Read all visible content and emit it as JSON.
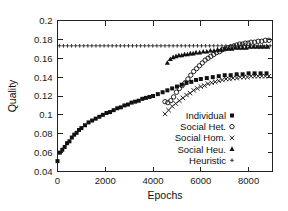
{
  "chart_data": {
    "type": "scatter",
    "title": "",
    "xlabel": "Epochs",
    "ylabel": "Quality",
    "xlim": [
      0,
      9000
    ],
    "ylim": [
      0.04,
      0.2
    ],
    "xticks": [
      0,
      2000,
      4000,
      6000,
      8000
    ],
    "xtick_labels": [
      "0",
      "2000",
      "4000",
      "6000",
      "8000"
    ],
    "yticks": [
      0.04,
      0.06,
      0.08,
      0.1,
      0.12,
      0.14,
      0.16,
      0.18,
      0.2
    ],
    "ytick_labels": [
      "0.04",
      "0.06",
      "0.08",
      "0.1",
      "0.12",
      "0.14",
      "0.16",
      "0.18",
      "0.2"
    ],
    "grid": false,
    "legend_position": "center-right-inside",
    "series": [
      {
        "name": "Individual",
        "marker": "filled-square",
        "x": [
          0,
          100,
          200,
          300,
          400,
          500,
          600,
          700,
          800,
          900,
          1000,
          1150,
          1300,
          1450,
          1600,
          1750,
          1900,
          2050,
          2200,
          2350,
          2500,
          2650,
          2800,
          2950,
          3100,
          3250,
          3400,
          3550,
          3700,
          3850,
          4000,
          4200,
          4400,
          4600,
          4800,
          5000,
          5200,
          5400,
          5600,
          5800,
          6000,
          6250,
          6500,
          6750,
          7000,
          7250,
          7500,
          7750,
          8000,
          8250,
          8500,
          8750
        ],
        "y": [
          0.051,
          0.06,
          0.063,
          0.066,
          0.07,
          0.072,
          0.076,
          0.079,
          0.081,
          0.084,
          0.086,
          0.089,
          0.092,
          0.094,
          0.096,
          0.098,
          0.1,
          0.102,
          0.103,
          0.105,
          0.107,
          0.108,
          0.11,
          0.111,
          0.113,
          0.114,
          0.115,
          0.117,
          0.118,
          0.119,
          0.12,
          0.122,
          0.124,
          0.126,
          0.128,
          0.13,
          0.132,
          0.134,
          0.135,
          0.137,
          0.138,
          0.139,
          0.14,
          0.141,
          0.142,
          0.142,
          0.143,
          0.143,
          0.144,
          0.144,
          0.144,
          0.144
        ]
      },
      {
        "name": "Social Het.",
        "marker": "open-circle",
        "x": [
          4500,
          4620,
          4740,
          4860,
          4980,
          5100,
          5220,
          5340,
          5460,
          5580,
          5700,
          5820,
          5940,
          6060,
          6180,
          6300,
          6420,
          6540,
          6660,
          6780,
          6900,
          7020,
          7140,
          7260,
          7380,
          7500,
          7620,
          7740,
          7860,
          7980,
          8100,
          8250,
          8400,
          8550,
          8700,
          8850
        ],
        "y": [
          0.114,
          0.113,
          0.115,
          0.119,
          0.124,
          0.128,
          0.131,
          0.134,
          0.138,
          0.142,
          0.146,
          0.149,
          0.152,
          0.155,
          0.158,
          0.16,
          0.162,
          0.164,
          0.166,
          0.167,
          0.169,
          0.17,
          0.171,
          0.172,
          0.173,
          0.174,
          0.175,
          0.175,
          0.176,
          0.176,
          0.177,
          0.177,
          0.178,
          0.178,
          0.179,
          0.179
        ]
      },
      {
        "name": "Social Hom.",
        "marker": "cross",
        "x": [
          4500,
          4650,
          4800,
          4950,
          5100,
          5250,
          5400,
          5550,
          5700,
          5850,
          6000,
          6150,
          6300,
          6450,
          6600,
          6750,
          6900,
          7050,
          7200,
          7350,
          7500,
          7650,
          7800,
          7950,
          8100,
          8250,
          8400,
          8550,
          8700,
          8850
        ],
        "y": [
          0.101,
          0.105,
          0.109,
          0.112,
          0.115,
          0.118,
          0.121,
          0.123,
          0.126,
          0.128,
          0.13,
          0.131,
          0.133,
          0.134,
          0.135,
          0.136,
          0.137,
          0.138,
          0.138,
          0.139,
          0.139,
          0.14,
          0.14,
          0.14,
          0.141,
          0.141,
          0.141,
          0.141,
          0.141,
          0.141
        ]
      },
      {
        "name": "Social Heu.",
        "marker": "filled-triangle",
        "x": [
          4600,
          4720,
          4840,
          4960,
          5080,
          5200,
          5320,
          5440,
          5560,
          5680,
          5800,
          5950,
          6100,
          6250,
          6400,
          6550,
          6700,
          6850,
          7000,
          7150,
          7300,
          7450,
          7600,
          7750,
          7900,
          8050,
          8200,
          8350,
          8500,
          8650,
          8800
        ],
        "y": [
          0.155,
          0.159,
          0.161,
          0.162,
          0.163,
          0.163,
          0.164,
          0.164,
          0.165,
          0.165,
          0.166,
          0.166,
          0.167,
          0.167,
          0.168,
          0.168,
          0.169,
          0.169,
          0.17,
          0.17,
          0.17,
          0.171,
          0.171,
          0.171,
          0.171,
          0.172,
          0.172,
          0.172,
          0.172,
          0.172,
          0.172
        ]
      },
      {
        "name": "Heuristic",
        "marker": "plus",
        "x": [
          80,
          250,
          420,
          590,
          760,
          930,
          1100,
          1270,
          1440,
          1610,
          1780,
          1950,
          2120,
          2290,
          2460,
          2630,
          2800,
          2970,
          3140,
          3310,
          3480,
          3650,
          3820,
          3990,
          4160,
          4330,
          4500,
          4670,
          4840,
          5010,
          5180,
          5350,
          5520,
          5690,
          5860,
          6030,
          6200,
          6370,
          6540,
          6710,
          6880,
          7050,
          7220,
          7390,
          7560,
          7730,
          7900,
          8070,
          8240,
          8410,
          8580,
          8750,
          8900
        ],
        "y": [
          0.1732,
          0.1732,
          0.1732,
          0.1732,
          0.1732,
          0.1732,
          0.1732,
          0.1732,
          0.1732,
          0.1732,
          0.1732,
          0.1732,
          0.1732,
          0.1732,
          0.1732,
          0.1732,
          0.1732,
          0.1732,
          0.1732,
          0.1732,
          0.1732,
          0.1732,
          0.1732,
          0.1732,
          0.1732,
          0.1732,
          0.1732,
          0.1732,
          0.1732,
          0.1732,
          0.1732,
          0.1732,
          0.1732,
          0.1732,
          0.1732,
          0.1732,
          0.1732,
          0.1732,
          0.1732,
          0.1732,
          0.1732,
          0.1732,
          0.1732,
          0.1732,
          0.1732,
          0.1732,
          0.1732,
          0.1732,
          0.1732,
          0.1732,
          0.1732,
          0.1732,
          0.1732
        ]
      }
    ],
    "colors": {
      "axis": "#222222",
      "series": "#111111",
      "background": "#ffffff"
    }
  },
  "legend": {
    "items": [
      {
        "label": "Individual",
        "marker": "filled-square"
      },
      {
        "label": "Social Het.",
        "marker": "open-circle"
      },
      {
        "label": "Social Hom.",
        "marker": "cross"
      },
      {
        "label": "Social Heu.",
        "marker": "filled-triangle"
      },
      {
        "label": "Heuristic",
        "marker": "plus"
      }
    ]
  }
}
